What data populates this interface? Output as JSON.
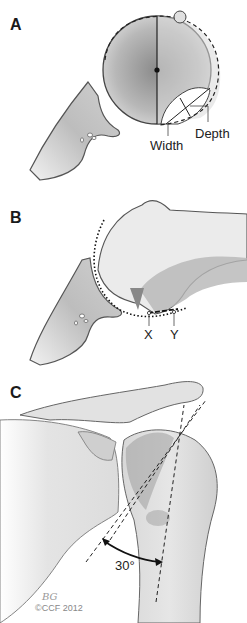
{
  "figure": {
    "panels": [
      {
        "label": "A",
        "description": "Glenoid and humeral head view with defect measurement",
        "annotations": {
          "width": "Width",
          "depth": "Depth"
        }
      },
      {
        "label": "B",
        "description": "Axial view of humeral head with glenoid arc",
        "annotations": {
          "x": "X",
          "y": "Y"
        }
      },
      {
        "label": "C",
        "description": "Anterior view of shoulder with angle measurement",
        "annotations": {
          "angle": "30°"
        }
      }
    ],
    "signature": "BG",
    "copyright": "©CCF 2012"
  },
  "colors": {
    "bone_fill": "#e8e8e8",
    "bone_dark": "#b0b0b0",
    "outline": "#555555",
    "text": "#1a1a1a"
  }
}
